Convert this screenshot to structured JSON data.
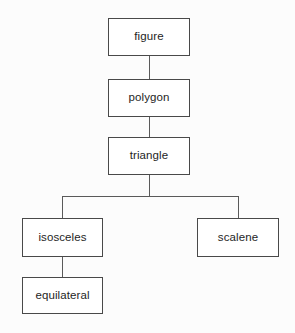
{
  "diagram": {
    "type": "hierarchy-tree",
    "title": "",
    "background_color": "#fcfcfc",
    "box_fill_color": "#ffffff",
    "box_border_color": "#494949",
    "edge_color": "#5a5a5a",
    "text_color": "#1e1e1e",
    "nodes": [
      {
        "id": "figure",
        "label": "figure",
        "x": 108,
        "y": 18,
        "w": 82,
        "h": 38,
        "level": 0
      },
      {
        "id": "polygon",
        "label": "polygon",
        "x": 108,
        "y": 79,
        "w": 82,
        "h": 38,
        "level": 1
      },
      {
        "id": "triangle",
        "label": "triangle",
        "x": 108,
        "y": 137,
        "w": 82,
        "h": 38,
        "level": 2
      },
      {
        "id": "isosceles",
        "label": "isosceles",
        "x": 22,
        "y": 218,
        "w": 81,
        "h": 39,
        "level": 3
      },
      {
        "id": "scalene",
        "label": "scalene",
        "x": 197,
        "y": 218,
        "w": 82,
        "h": 39,
        "level": 3
      },
      {
        "id": "equilateral",
        "label": "equilateral",
        "x": 22,
        "y": 277,
        "w": 81,
        "h": 37,
        "level": 4
      }
    ],
    "edges": [
      {
        "from": "figure",
        "to": "polygon",
        "kind": "straight"
      },
      {
        "from": "polygon",
        "to": "triangle",
        "kind": "straight"
      },
      {
        "from": "triangle",
        "to": "isosceles",
        "kind": "elbow-left"
      },
      {
        "from": "triangle",
        "to": "scalene",
        "kind": "elbow-right"
      },
      {
        "from": "isosceles",
        "to": "equilateral",
        "kind": "straight"
      }
    ]
  }
}
